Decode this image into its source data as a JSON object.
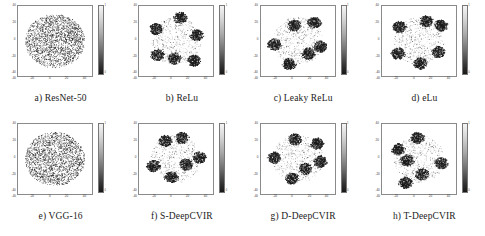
{
  "figure": {
    "type": "scatter-grid",
    "rows": 2,
    "cols": 4,
    "colorbar": {
      "orientation": "vertical",
      "top_label": "1",
      "bottom_label": "0",
      "low_color": "#171717",
      "high_color": "#f4f4f4"
    },
    "axis": {
      "x_ticks": [
        "-40",
        "-20",
        "0",
        "20",
        "40"
      ],
      "y_ticks": [
        "40",
        "20",
        "0",
        "-20",
        "-40"
      ],
      "xlim": [
        -50,
        50
      ],
      "ylim": [
        -50,
        50
      ]
    }
  },
  "panels": [
    {
      "id": "a",
      "caption": "a) ResNet-50",
      "style": "diffuse",
      "description": "single diffuse cloud, no cluster separation"
    },
    {
      "id": "b",
      "caption": "b) ReLu",
      "style": "clustered",
      "description": "six dense dark clusters with light scattered background"
    },
    {
      "id": "c",
      "caption": "c) Leaky ReLu",
      "style": "clustered",
      "description": "six dense dark clusters with light scattered background"
    },
    {
      "id": "d",
      "caption": "d) eLu",
      "style": "clustered",
      "description": "five dense dark clusters with light scattered background"
    },
    {
      "id": "e",
      "caption": "e) VGG-16",
      "style": "diffuse",
      "description": "single diffuse cloud, no cluster separation"
    },
    {
      "id": "f",
      "caption": "f) S-DeepCVIR",
      "style": "clustered",
      "description": "six dense dark clusters with light scattered background"
    },
    {
      "id": "g",
      "caption": "g) D-DeepCVIR",
      "style": "clustered",
      "description": "six dense dark clusters with light scattered background"
    },
    {
      "id": "h",
      "caption": "h) T-DeepCVIR",
      "style": "clustered",
      "description": "six dense dark clusters with light scattered background"
    }
  ],
  "chart_data": {
    "type": "scatter",
    "title": "",
    "xlabel": "",
    "ylabel": "",
    "xlim": [
      -50,
      50
    ],
    "ylim": [
      -50,
      50
    ],
    "grid": false,
    "legend": "none",
    "colorbar_range": [
      0,
      1
    ],
    "subplots": [
      {
        "id": "a",
        "title": "a) ResNet-50",
        "mode": "diffuse",
        "n_points": 2000,
        "cluster_centers": [
          [
            0,
            0
          ]
        ],
        "cluster_spread": [
          26
        ]
      },
      {
        "id": "b",
        "title": "b) ReLu",
        "mode": "clustered",
        "n_points": 2000,
        "cluster_centers": [
          [
            -27,
            17
          ],
          [
            6,
            33
          ],
          [
            28,
            8
          ],
          [
            -25,
            -20
          ],
          [
            -2,
            -25
          ],
          [
            24,
            -28
          ]
        ],
        "cluster_spread": [
          7,
          7,
          7,
          7,
          7,
          7
        ]
      },
      {
        "id": "c",
        "title": "c) Leaky ReLu",
        "mode": "clustered",
        "n_points": 2000,
        "cluster_centers": [
          [
            -5,
            22
          ],
          [
            22,
            26
          ],
          [
            -32,
            -5
          ],
          [
            30,
            -8
          ],
          [
            -12,
            -33
          ],
          [
            14,
            -18
          ]
        ],
        "cluster_spread": [
          7,
          7,
          7,
          7,
          7,
          7
        ]
      },
      {
        "id": "d",
        "title": "d) eLu",
        "mode": "clustered",
        "n_points": 2000,
        "cluster_centers": [
          [
            -26,
            20
          ],
          [
            10,
            28
          ],
          [
            30,
            22
          ],
          [
            -28,
            -18
          ],
          [
            26,
            -16
          ],
          [
            2,
            -32
          ]
        ],
        "cluster_spread": [
          7,
          7,
          7,
          7,
          7,
          7
        ]
      },
      {
        "id": "e",
        "title": "e) VGG-16",
        "mode": "diffuse",
        "n_points": 2000,
        "cluster_centers": [
          [
            0,
            0
          ]
        ],
        "cluster_spread": [
          26
        ]
      },
      {
        "id": "f",
        "title": "f) S-DeepCVIR",
        "mode": "clustered",
        "n_points": 2000,
        "cluster_centers": [
          [
            -14,
            26
          ],
          [
            8,
            30
          ],
          [
            32,
            2
          ],
          [
            -30,
            -10
          ],
          [
            14,
            -8
          ],
          [
            -6,
            -26
          ]
        ],
        "cluster_spread": [
          7,
          7,
          7,
          7,
          7,
          7
        ]
      },
      {
        "id": "g",
        "title": "g) D-DeepCVIR",
        "mode": "clustered",
        "n_points": 2000,
        "cluster_centers": [
          [
            -4,
            28
          ],
          [
            26,
            22
          ],
          [
            -32,
            2
          ],
          [
            30,
            -4
          ],
          [
            -8,
            -28
          ],
          [
            10,
            -14
          ]
        ],
        "cluster_spread": [
          7,
          7,
          7,
          7,
          7,
          7
        ]
      },
      {
        "id": "h",
        "title": "h) T-DeepCVIR",
        "mode": "clustered",
        "n_points": 2000,
        "cluster_centers": [
          [
            -2,
            30
          ],
          [
            -28,
            14
          ],
          [
            -16,
            -2
          ],
          [
            30,
            -6
          ],
          [
            4,
            -22
          ],
          [
            -18,
            -34
          ]
        ],
        "cluster_spread": [
          7,
          7,
          7,
          7,
          7,
          7
        ]
      }
    ]
  }
}
